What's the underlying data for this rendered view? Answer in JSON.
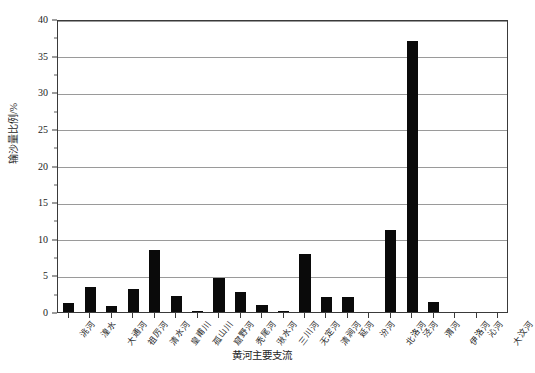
{
  "chart_data": {
    "type": "bar",
    "title": "",
    "xlabel": "黄河主要支流",
    "ylabel": "输沙量比例/%",
    "ylim": [
      0,
      40
    ],
    "ytick_labels": [
      "0",
      "5",
      "10",
      "15",
      "20",
      "25",
      "30",
      "35",
      "40"
    ],
    "ytick_values": [
      0,
      5,
      10,
      15,
      20,
      25,
      30,
      35,
      40
    ],
    "grid": true,
    "grid_axis": "y",
    "legend": "none",
    "bar_color": "#0a0a0a",
    "categories": [
      "洮河",
      "湟水",
      "大通河",
      "祖厉河",
      "清水河",
      "皇甫川",
      "孤山川",
      "窟野河",
      "秃尾河",
      "湫水河",
      "三川河",
      "无定河",
      "清涧河",
      "延河",
      "汾河",
      "北洛河",
      "泾河",
      "渭河",
      "伊洛河",
      "沁河",
      "大汶河"
    ],
    "values": [
      1.2,
      3.4,
      0.8,
      3.2,
      8.5,
      2.2,
      0.2,
      4.6,
      2.8,
      0.9,
      0.2,
      7.9,
      2.1,
      2.1,
      0.0,
      11.2,
      37.0,
      1.3,
      0.0,
      0.0,
      0.0
    ]
  }
}
